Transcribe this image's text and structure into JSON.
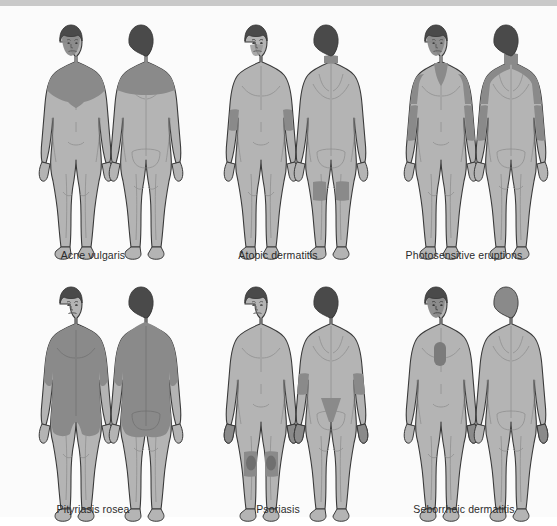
{
  "figure": {
    "layout": {
      "rows": 2,
      "columns": 3,
      "views_per_panel": 2
    },
    "background_color": "#fbfbfb",
    "top_strip_color": "#c9c9c9",
    "colors": {
      "skin_fill": "#b4b4b4",
      "skin_shade": "#a2a2a2",
      "highlight": "#8a8a8a",
      "highlight_dark": "#6f6f6f",
      "hair_dark": "#4a4a4a",
      "outline": "#3a3a3a",
      "caption_text": "#2b2b2b"
    }
  },
  "panels": [
    {
      "id": "acne-vulgaris",
      "caption": "Acne vulgaris",
      "row": 1,
      "column": 1,
      "views": [
        "anterior",
        "posterior"
      ],
      "affected_regions": [
        "face",
        "neck",
        "upper chest",
        "shoulders",
        "scalp",
        "upper back"
      ]
    },
    {
      "id": "atopic-dermatitis",
      "caption": "Atopic dermatitis",
      "row": 1,
      "column": 2,
      "views": [
        "anterior",
        "posterior"
      ],
      "affected_regions": [
        "face",
        "antecubital fossae",
        "neck",
        "popliteal fossae"
      ]
    },
    {
      "id": "photosensitive-eruptions",
      "caption": "Photosensitive eruptions",
      "row": 1,
      "column": 3,
      "views": [
        "anterior",
        "posterior"
      ],
      "affected_regions": [
        "face",
        "V of neck and chest",
        "forearms",
        "hands",
        "posterior neck",
        "upper back",
        "scalp"
      ]
    },
    {
      "id": "pityriasis-rosea",
      "caption": "Pityriasis rosea",
      "row": 2,
      "column": 1,
      "views": [
        "anterior",
        "posterior"
      ],
      "affected_regions": [
        "trunk",
        "upper arms",
        "thighs",
        "back"
      ]
    },
    {
      "id": "psoriasis",
      "caption": "Psoriasis",
      "row": 2,
      "column": 2,
      "views": [
        "anterior",
        "posterior"
      ],
      "affected_regions": [
        "scalp",
        "elbows",
        "knees",
        "hands",
        "sacrum",
        "lower legs"
      ]
    },
    {
      "id": "seborrheic-dermatitis",
      "caption": "Seborrheic dermatitis",
      "row": 2,
      "column": 3,
      "views": [
        "anterior",
        "posterior"
      ],
      "affected_regions": [
        "scalp",
        "eyebrows",
        "nasolabial folds",
        "presternal chest",
        "hands"
      ]
    }
  ]
}
